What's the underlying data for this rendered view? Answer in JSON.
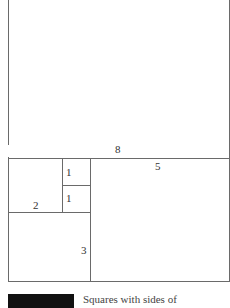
{
  "diagram": {
    "type": "fibonacci-squares",
    "squares": [
      {
        "label": "8"
      },
      {
        "label": "5"
      },
      {
        "label": "1"
      },
      {
        "label": "1"
      },
      {
        "label": "2"
      },
      {
        "label": "3"
      }
    ]
  },
  "caption": {
    "label": "FIGURE",
    "text": "Squares with sides of"
  }
}
